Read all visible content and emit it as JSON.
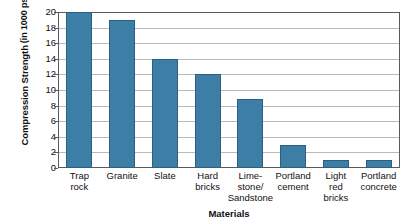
{
  "chart_data": {
    "type": "bar",
    "title": "",
    "xlabel": "Materials",
    "ylabel_line1": "Compression Strength",
    "ylabel_line2": "(in 1000 psi)",
    "categories": [
      "Trap rock",
      "Granite",
      "Slate",
      "Hard bricks",
      "Lime-stone/ Sandstone",
      "Portland cement",
      "Light red bricks",
      "Portland concrete"
    ],
    "category_lines": [
      [
        "Trap",
        "rock"
      ],
      [
        "Granite"
      ],
      [
        "Slate"
      ],
      [
        "Hard",
        "bricks"
      ],
      [
        "Lime-",
        "stone/",
        "Sandstone"
      ],
      [
        "Portland",
        "cement"
      ],
      [
        "Light",
        "red",
        "bricks"
      ],
      [
        "Portland",
        "concrete"
      ]
    ],
    "values": [
      20,
      19,
      14,
      12,
      8.9,
      3,
      1,
      1
    ],
    "ylim": [
      0,
      20
    ],
    "ytick_step": 2,
    "ytick_labels": [
      "20",
      "18",
      "16",
      "14",
      "12",
      "10",
      "8",
      "6",
      "4",
      "2",
      "0"
    ],
    "grid": true,
    "legend": false,
    "bar_color": "#3d7ea6",
    "bar_border_color": "#2c5f80",
    "gridline_color": "#b9b9b9",
    "frame_color": "#5a5a5a",
    "background_color": "#ffffff"
  }
}
